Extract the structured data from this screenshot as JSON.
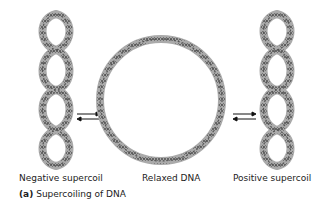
{
  "figure": {
    "labels": {
      "negative": "Negative supercoil",
      "relaxed": "Relaxed DNA",
      "positive": "Positive supercoil"
    },
    "caption": {
      "tag": "(a)",
      "text": " Supercoiling of DNA"
    },
    "colors": {
      "strand": "#555555",
      "outline": "#aaaaaa",
      "arrow": "#111111"
    }
  }
}
